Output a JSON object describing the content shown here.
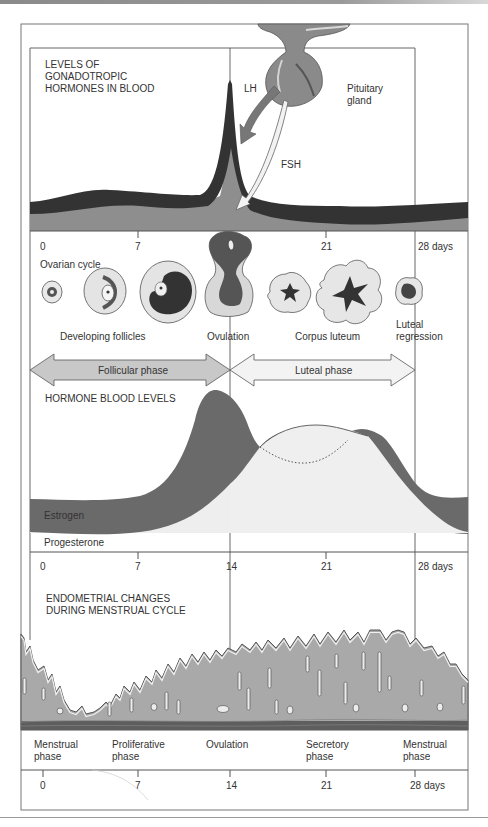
{
  "figure": {
    "panels": {
      "gonadotropic": {
        "title_line1": "LEVELS OF",
        "title_line2": "GONADOTROPIC",
        "title_line3": "HORMONES IN BLOOD",
        "lh_label": "LH",
        "fsh_label": "FSH",
        "gland_label_line1": "Pituitary",
        "gland_label_line2": "gland"
      },
      "ovarian": {
        "axis_ticks": [
          "0",
          "7",
          "14",
          "21",
          "28 days"
        ],
        "cycle_label": "Ovarian cycle",
        "stage_labels": {
          "developing": "Developing follicles",
          "ovulation": "Ovulation",
          "corpus_luteum": "Corpus luteum",
          "regression_line1": "Luteal",
          "regression_line2": "regression"
        },
        "phase_arrows": {
          "follicular": "Follicular phase",
          "luteal": "Luteal phase"
        }
      },
      "hormone_levels": {
        "title": "HORMONE BLOOD LEVELS",
        "estrogen_label": "Estrogen",
        "progesterone_label": "Progesterone",
        "axis_ticks": [
          "0",
          "7",
          "14",
          "21",
          "28 days"
        ]
      },
      "endometrial": {
        "title_line1": "ENDOMETRIAL CHANGES",
        "title_line2": "DURING MENSTRUAL CYCLE",
        "phases": [
          {
            "line1": "Menstrual",
            "line2": "phase"
          },
          {
            "line1": "Proliferative",
            "line2": "phase"
          },
          {
            "line1": "Ovulation",
            "line2": ""
          },
          {
            "line1": "Secretory",
            "line2": "phase"
          },
          {
            "line1": "Menstrual",
            "line2": "phase"
          }
        ],
        "axis_ticks": [
          "0",
          "7",
          "14",
          "21",
          "28 days"
        ]
      }
    },
    "colors": {
      "dark_hormone": "#3a3a3a",
      "mid_gray": "#8c8c8c",
      "light_fill": "#ececec",
      "estrogen": "#6a6a6a",
      "progesterone": "#efefef",
      "frame": "#666666",
      "tissue": "#a9a9a9"
    }
  }
}
